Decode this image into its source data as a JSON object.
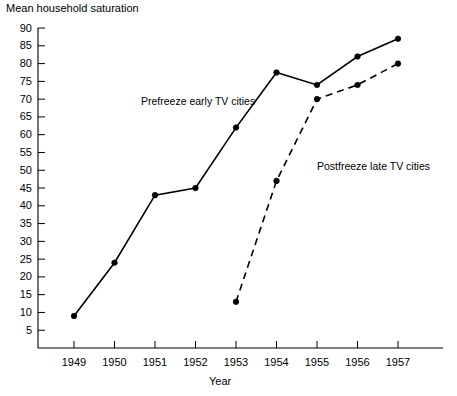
{
  "chart_data": {
    "type": "line",
    "title": "",
    "ylabel": "Mean household saturation",
    "xlabel": "Year",
    "x": [
      1949,
      1950,
      1951,
      1952,
      1953,
      1954,
      1955,
      1956,
      1957
    ],
    "xticklabels": [
      "1949",
      "1950",
      "1951",
      "1952",
      "1953",
      "1954",
      "1955",
      "1956",
      "1957"
    ],
    "yticklabels": [
      "90",
      "85",
      "80",
      "75",
      "70",
      "65",
      "60",
      "55",
      "50",
      "45",
      "40",
      "35",
      "30",
      "25",
      "20",
      "15",
      "10",
      "5"
    ],
    "ylim": [
      0,
      92
    ],
    "xlim": [
      1948.4,
      1957.7
    ],
    "grid": false,
    "legend_position": "inline-annotations",
    "series": [
      {
        "name": "Prefreeze early TV cities",
        "style": "solid",
        "marker": "filled-circle",
        "color": "#000000",
        "x": [
          1949,
          1950,
          1951,
          1952,
          1953,
          1954,
          1955,
          1956,
          1957
        ],
        "values": [
          9,
          24,
          43,
          45,
          62,
          77.5,
          74,
          82,
          87
        ]
      },
      {
        "name": "Postfreeze late TV cities",
        "style": "dashed",
        "marker": "filled-circle",
        "color": "#000000",
        "x": [
          1953,
          1954,
          1955,
          1956,
          1957
        ],
        "values": [
          13,
          47,
          70,
          74,
          80
        ]
      }
    ],
    "annotations": [
      {
        "text": "Prefreeze early TV cities",
        "x": 1951.9,
        "y": 69
      },
      {
        "text": "Postfreeze late TV cities",
        "x": 1955.1,
        "y": 53
      }
    ]
  },
  "axes": {
    "y_title": "Mean household saturation",
    "x_title": "Year"
  }
}
